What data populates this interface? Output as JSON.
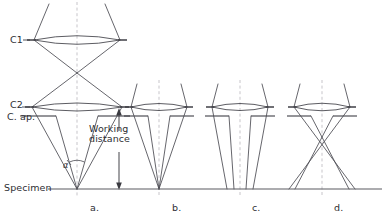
{
  "figure": {
    "kind": "optical-ray-diagram",
    "width": 386,
    "height": 221,
    "background_color": "#ffffff",
    "ray_color": "#4a4a52",
    "axis_color": "#b9b6bc",
    "text_color": "#2e2e33",
    "specimen_color": "#5a5a60"
  },
  "labels": {
    "c1": "C1",
    "c2": "C2",
    "condenser_aperture": "C. ap.",
    "specimen": "Specimen",
    "working_distance_line1": "Working",
    "working_distance_line2": "distance",
    "alpha": "α"
  },
  "panels": [
    {
      "id": "a",
      "label": "a.",
      "axis_x": 77,
      "description": "Strong C2: beam crosses over at C1 then focuses to a point on the specimen with large convergence angle alpha",
      "has_c1": true,
      "has_aperture": true,
      "crossover_at_specimen": true
    },
    {
      "id": "b",
      "label": "b.",
      "axis_x": 159,
      "description": "Narrow cone focused to a point on the specimen, small convergence angle",
      "has_c1": false,
      "has_aperture": true,
      "crossover_at_specimen": true
    },
    {
      "id": "c",
      "label": "c.",
      "axis_x": 240,
      "description": "Underfocused C2: broad weakly converging beam illuminating a wide area of the specimen",
      "has_c1": false,
      "has_aperture": true,
      "crossover_at_specimen": false
    },
    {
      "id": "d",
      "label": "d.",
      "axis_x": 322,
      "description": "Overfocused C2: beam crosses over above the specimen then diverges to a wide illuminated area",
      "has_c1": false,
      "has_aperture": true,
      "crossover_at_specimen": false
    }
  ],
  "geometry": {
    "c1_plane_y": 40,
    "c2_plane_y": 107,
    "aperture_plane_y": 116,
    "specimen_plane_y": 189,
    "specimen_line_x1": 48,
    "specimen_line_x2": 382
  },
  "annotations": {
    "working_distance": {
      "text": "Working distance",
      "from_y": 112,
      "to_y": 189,
      "arrow_x": 119,
      "double_headed": true
    },
    "convergence_angle": {
      "symbol": "α",
      "panel": "a",
      "at_x": 77,
      "at_y": 189
    }
  }
}
